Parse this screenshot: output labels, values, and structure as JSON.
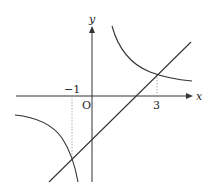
{
  "diagram": {
    "type": "function-graph",
    "axes": {
      "x_label": "x",
      "y_label": "y",
      "origin_label": "O"
    },
    "ticks": {
      "x_neg": "−1",
      "x_pos": "3"
    },
    "curves": [
      {
        "name": "hyperbola",
        "kind": "reciprocal",
        "branches": 2
      },
      {
        "name": "line",
        "kind": "linear"
      }
    ],
    "intersections": [
      {
        "x": -1
      },
      {
        "x": 3
      }
    ],
    "colors": {
      "stroke": "#333333",
      "guide": "#888888"
    }
  }
}
